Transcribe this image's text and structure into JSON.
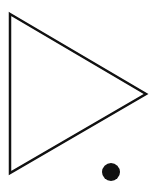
{
  "canvas": {
    "width": 158,
    "height": 187,
    "background": "#ffffff"
  },
  "shapes": {
    "triangle": {
      "points": "10,14 146,94 10,173",
      "stroke": "#111111",
      "stroke_width": 2.5,
      "fill": "none",
      "orientation": "pointing-right"
    },
    "dot": {
      "cx": 111,
      "cy": 172,
      "r": 9,
      "fill": "#111111"
    }
  }
}
